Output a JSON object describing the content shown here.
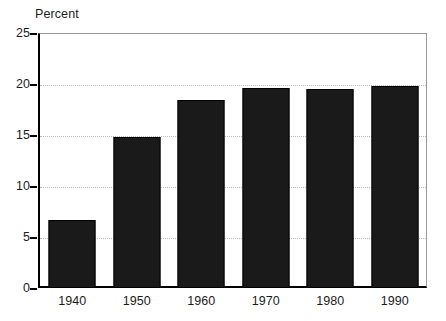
{
  "chart_data": {
    "type": "bar",
    "title": "Percent",
    "xlabel": "",
    "ylabel": "Percent",
    "categories": [
      "1940",
      "1950",
      "1960",
      "1970",
      "1980",
      "1990"
    ],
    "values": [
      6.7,
      14.8,
      18.4,
      19.6,
      19.5,
      19.8
    ],
    "ylim": [
      0,
      25
    ],
    "yticks": [
      "0",
      "5",
      "10",
      "15",
      "20",
      "25"
    ],
    "ytick_values": [
      0,
      5,
      10,
      15,
      20,
      25
    ],
    "grid": "horizontal-dotted",
    "gridline_values": [
      5,
      10,
      15,
      20
    ],
    "legend": null,
    "legend_position": "none",
    "bar_color": "#1a1a1a",
    "grid_color": "#b9b9b9",
    "axis_color": "#000000",
    "frame_color": "#9a9a9a",
    "background": "#ffffff"
  },
  "axis_title": "Percent"
}
